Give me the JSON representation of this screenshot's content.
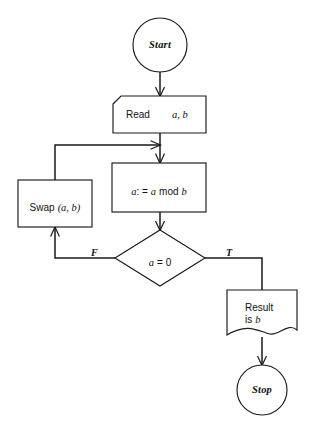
{
  "diagram": {
    "type": "flowchart",
    "background_color": "#ffffff",
    "line_color": "#1a1a1a",
    "width": 316,
    "height": 430
  },
  "nodes": {
    "start": {
      "label": "Start",
      "shape": "circle",
      "cx": 160,
      "cy": 45,
      "r": 27
    },
    "read": {
      "label_main": "Read",
      "label_vars": "a, b",
      "shape": "input-notched-box",
      "x": 113,
      "y": 96,
      "w": 93,
      "h": 37
    },
    "mod": {
      "label_prefix": "a",
      "label_op": ": =",
      "label_var2": "a",
      "label_mod": "mod",
      "label_var3": "b",
      "label_full": "a: = a mod b",
      "shape": "rectangle",
      "x": 112,
      "y": 163,
      "w": 94,
      "h": 49
    },
    "swap": {
      "label_main": "Swap",
      "label_args": "(a, b)",
      "label_full": "Swap (a, b)",
      "shape": "rectangle",
      "x": 18,
      "y": 180,
      "w": 74,
      "h": 47
    },
    "decision": {
      "label_var": "a",
      "label_rest": "= 0",
      "label_full": "a = 0",
      "shape": "diamond",
      "cx": 160,
      "cy": 258,
      "hw": 45,
      "hh": 28
    },
    "result": {
      "label_line1": "Result",
      "label_line2_prefix": "is",
      "label_line2_var": "b",
      "shape": "document-wavy-bottom",
      "x": 227,
      "y": 290,
      "w": 70,
      "h": 45
    },
    "stop": {
      "label": "Stop",
      "shape": "circle",
      "cx": 262,
      "cy": 390,
      "r": 25
    }
  },
  "edges": [
    {
      "name": "start-to-read",
      "from": "start",
      "to": "read",
      "label": ""
    },
    {
      "name": "read-to-mod",
      "from": "read",
      "to": "mod",
      "label": ""
    },
    {
      "name": "mod-to-decision",
      "from": "mod",
      "to": "decision",
      "label": ""
    },
    {
      "name": "decision-false-to-swap",
      "from": "decision",
      "to": "swap",
      "label": "F"
    },
    {
      "name": "decision-true-to-result",
      "from": "decision",
      "to": "result",
      "label": "T"
    },
    {
      "name": "swap-to-mod-loopback",
      "from": "swap",
      "to": "mod",
      "label": ""
    },
    {
      "name": "result-to-stop",
      "from": "result",
      "to": "stop",
      "label": ""
    }
  ],
  "branch_labels": {
    "false": "F",
    "true": "T"
  }
}
